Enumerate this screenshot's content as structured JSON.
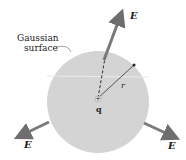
{
  "diagram": {
    "title_label_line1": "Gaussian",
    "title_label_line2": "surface",
    "charge_label": "q",
    "charge_sign": "+",
    "radius_label": "r",
    "field_label": "E",
    "colors": {
      "sphere": "#d4d4d4",
      "arrow": "#7a7a7a",
      "text": "#222222"
    }
  }
}
